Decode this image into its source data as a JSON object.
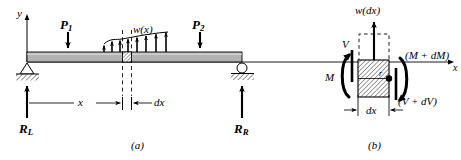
{
  "figure": {
    "title_a": "(a)",
    "title_b": "(b)",
    "beam_color": "#b3b3b3",
    "line_color": "#000000",
    "hatch_color": "#000000"
  },
  "panel_a": {
    "name": "simply-supported-beam-loading-diagram",
    "axis_y_label": "y",
    "axis_x_label": "x",
    "point_load_1": "P",
    "point_load_1_sub": "1",
    "point_load_2": "P",
    "point_load_2_sub": "2",
    "distributed_load": "w(x)",
    "reaction_left": "R",
    "reaction_left_sub": "L",
    "reaction_right": "R",
    "reaction_right_sub": "R",
    "dim_x": "x",
    "dim_dx": "dx",
    "support_left_type": "pin-support",
    "support_right_type": "roller-support",
    "caption": "(a)"
  },
  "panel_b": {
    "name": "differential-element-free-body-diagram",
    "distributed_load": "w(dx)",
    "shear_left": "V",
    "shear_right": "(V + dV)",
    "moment_left": "M",
    "moment_right": "(M + dM)",
    "radius_label": "r",
    "dim_dx": "dx",
    "caption": "(b)"
  }
}
